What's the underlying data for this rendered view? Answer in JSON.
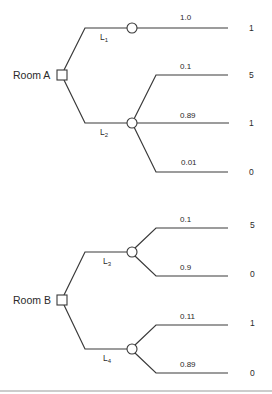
{
  "diagram": {
    "type": "decision-tree",
    "trees": [
      {
        "decision": "Room A",
        "lotteries": [
          {
            "name": "L",
            "subscript": "1",
            "outcomes": [
              {
                "probability": "1.0",
                "payoff": "1"
              }
            ]
          },
          {
            "name": "L",
            "subscript": "2",
            "outcomes": [
              {
                "probability": "0.1",
                "payoff": "5"
              },
              {
                "probability": "0.89",
                "payoff": "1"
              },
              {
                "probability": "0.01",
                "payoff": "0"
              }
            ]
          }
        ]
      },
      {
        "decision": "Room B",
        "lotteries": [
          {
            "name": "L",
            "subscript": "3",
            "outcomes": [
              {
                "probability": "0.1",
                "payoff": "5"
              },
              {
                "probability": "0.9",
                "payoff": "0"
              }
            ]
          },
          {
            "name": "L",
            "subscript": "4",
            "outcomes": [
              {
                "probability": "0.11",
                "payoff": "1"
              },
              {
                "probability": "0.89",
                "payoff": "0"
              }
            ]
          }
        ]
      }
    ]
  }
}
